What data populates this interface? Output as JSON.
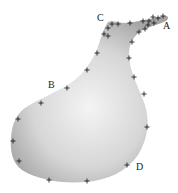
{
  "diagram": {
    "fill_color_center": "#f2f2f2",
    "fill_color_edge": "#a8a8a8",
    "marker_color": "#222222",
    "labels": [
      {
        "id": "A",
        "text": "A"
      },
      {
        "id": "B",
        "text": "B"
      },
      {
        "id": "C",
        "text": "C"
      },
      {
        "id": "D",
        "text": "D"
      }
    ],
    "landmark_count": 30
  }
}
